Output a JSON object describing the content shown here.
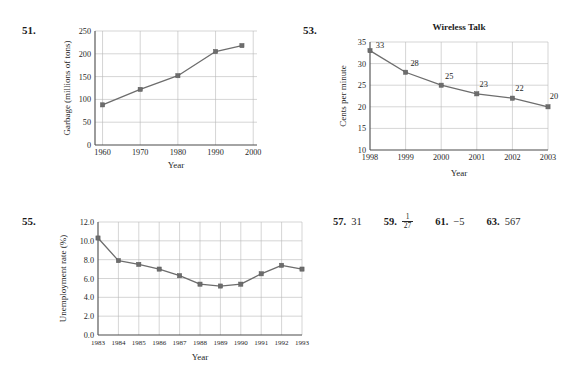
{
  "page": {
    "background": "#ffffff",
    "ink": "#231f20",
    "line_color": "#6d6d6d",
    "grid_color": "#b9b9b9",
    "axis_color": "#4a4a4a"
  },
  "exercises": {
    "e51": {
      "number": "51."
    },
    "e53": {
      "number": "53."
    },
    "e55": {
      "number": "55."
    }
  },
  "answers": [
    {
      "number": "57.",
      "value": "31",
      "is_fraction": false
    },
    {
      "number": "59.",
      "value": "",
      "is_fraction": true,
      "numerator": "1",
      "denominator": "27"
    },
    {
      "number": "61.",
      "value": "−5",
      "is_fraction": false
    },
    {
      "number": "63.",
      "value": "567",
      "is_fraction": false
    }
  ],
  "chart_data": [
    {
      "id": "garbage",
      "type": "line",
      "title": "",
      "xlabel": "Year",
      "ylabel": "Garbage (millions of tons)",
      "x": [
        1960,
        1970,
        1980,
        1990,
        1997
      ],
      "values": [
        88,
        122,
        152,
        205,
        218
      ],
      "xticks": [
        "1960",
        "1970",
        "1980",
        "1990",
        "2000"
      ],
      "xtick_values": [
        1960,
        1970,
        1980,
        1990,
        2000
      ],
      "yticks": [
        "0",
        "50",
        "100",
        "150",
        "200",
        "250"
      ],
      "ytick_values": [
        0,
        50,
        100,
        150,
        200,
        250
      ],
      "xlim": [
        1958,
        2001
      ],
      "ylim": [
        0,
        250
      ],
      "grid": true,
      "point_labels": [],
      "legend": "none"
    },
    {
      "id": "wireless-talk",
      "type": "line",
      "title": "Wireless Talk",
      "xlabel": "Year",
      "ylabel": "Cents per minute",
      "x": [
        1998,
        1999,
        2000,
        2001,
        2002,
        2003
      ],
      "values": [
        33,
        28,
        25,
        23,
        22,
        20
      ],
      "xticks": [
        "1998",
        "1999",
        "2000",
        "2001",
        "2002",
        "2003"
      ],
      "xtick_values": [
        1998,
        1999,
        2000,
        2001,
        2002,
        2003
      ],
      "yticks": [
        "10",
        "15",
        "20",
        "25",
        "30",
        "35"
      ],
      "ytick_values": [
        10,
        15,
        20,
        25,
        30,
        35
      ],
      "xlim": [
        1998,
        2003
      ],
      "ylim": [
        10,
        35
      ],
      "grid": true,
      "point_labels": [
        "33",
        "28",
        "25",
        "23",
        "22",
        "20"
      ],
      "legend": "none"
    },
    {
      "id": "unemployment",
      "type": "line",
      "title": "",
      "xlabel": "Year",
      "ylabel": "Unemployment rate (%)",
      "x": [
        1983,
        1984,
        1985,
        1986,
        1987,
        1988,
        1989,
        1990,
        1991,
        1992,
        1993
      ],
      "values": [
        10.3,
        7.9,
        7.5,
        7.0,
        6.3,
        5.4,
        5.2,
        5.4,
        6.5,
        7.4,
        7.0
      ],
      "xticks": [
        "1983",
        "1984",
        "1985",
        "1986",
        "1987",
        "1988",
        "1989",
        "1990",
        "1991",
        "1992",
        "1993"
      ],
      "xtick_values": [
        1983,
        1984,
        1985,
        1986,
        1987,
        1988,
        1989,
        1990,
        1991,
        1992,
        1993
      ],
      "yticks": [
        "0.0",
        "2.0",
        "4.0",
        "6.0",
        "8.0",
        "10.0",
        "12.0"
      ],
      "ytick_values": [
        0,
        2,
        4,
        6,
        8,
        10,
        12
      ],
      "xlim": [
        1983,
        1993
      ],
      "ylim": [
        0,
        12
      ],
      "grid": true,
      "point_labels": [],
      "legend": "none"
    }
  ]
}
